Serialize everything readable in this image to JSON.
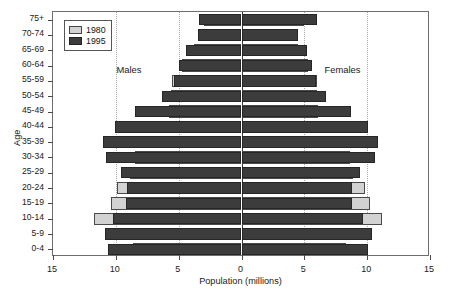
{
  "chart_data": {
    "type": "bar",
    "subtype": "population-pyramid",
    "title": "",
    "xlabel": "Population (millions)",
    "ylabel": "Age",
    "xlim": [
      -15,
      15
    ],
    "xticks": [
      15,
      10,
      5,
      0,
      5,
      10,
      15
    ],
    "xtick_labels": [
      "15",
      "10",
      "5",
      "0",
      "5",
      "10",
      "15"
    ],
    "grid": true,
    "grid_axis": "x",
    "legend_position": "top-left",
    "side_labels": {
      "left": "Males",
      "right": "Females"
    },
    "categories": [
      "0-4",
      "5-9",
      "10-14",
      "15-19",
      "20-24",
      "25-29",
      "30-34",
      "35-39",
      "40-44",
      "45-49",
      "50-54",
      "55-59",
      "60-64",
      "65-69",
      "70-74",
      "75+"
    ],
    "series": [
      {
        "name": "1980",
        "color": "#d2d2d2",
        "males": [
          8.6,
          9.0,
          11.7,
          10.4,
          9.9,
          8.9,
          8.5,
          7.6,
          6.4,
          5.8,
          5.6,
          5.5,
          4.7,
          3.8,
          2.9,
          3.0
        ],
        "females": [
          8.3,
          8.6,
          11.2,
          10.2,
          9.8,
          8.9,
          8.6,
          7.8,
          6.6,
          6.1,
          6.0,
          6.0,
          5.3,
          4.5,
          3.7,
          5.0
        ]
      },
      {
        "name": "1995",
        "color": "#3c3c3c",
        "males": [
          10.6,
          10.9,
          10.2,
          9.2,
          9.1,
          9.6,
          10.8,
          11.0,
          10.1,
          8.5,
          6.3,
          5.4,
          5.0,
          4.4,
          3.5,
          3.4
        ],
        "females": [
          10.1,
          10.4,
          9.7,
          8.8,
          8.8,
          9.4,
          10.6,
          10.9,
          10.1,
          8.7,
          6.7,
          5.9,
          5.6,
          5.2,
          4.5,
          6.0
        ]
      }
    ]
  },
  "legend": {
    "items": [
      {
        "label": "1980",
        "color": "#d2d2d2"
      },
      {
        "label": "1995",
        "color": "#3c3c3c"
      }
    ]
  },
  "axes": {
    "y_title": "Age",
    "x_title": "Population (millions)"
  }
}
